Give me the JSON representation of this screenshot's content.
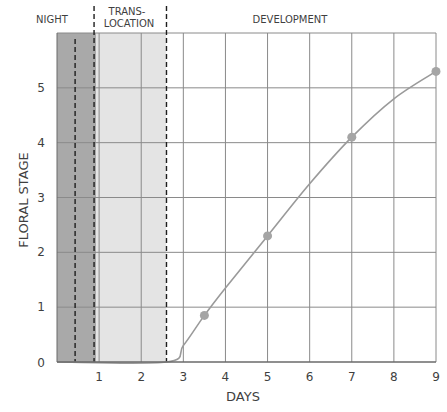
{
  "chart_data": {
    "type": "line",
    "title": "",
    "xlabel": "DAYS",
    "ylabel": "FLORAL STAGE",
    "xlim": [
      0,
      9
    ],
    "ylim": [
      0,
      6
    ],
    "x_ticks": [
      1,
      2,
      3,
      4,
      5,
      6,
      7,
      8,
      9
    ],
    "y_ticks": [
      0,
      1,
      2,
      3,
      4,
      5
    ],
    "grid": true,
    "phases": [
      {
        "label": "NIGHT",
        "start": 0,
        "end": 0.93,
        "shade": "#a9a9a9"
      },
      {
        "label": "TRANS-\nLOCATION",
        "start": 0.93,
        "end": 2.6,
        "shade": "#e4e4e4"
      },
      {
        "label": "DEVELOPMENT",
        "start": 2.6,
        "end": 9,
        "shade": "#ffffff"
      }
    ],
    "dashed_lines_x": [
      0.43,
      0.88,
      2.6
    ],
    "series": [
      {
        "name": "Floral stage",
        "curve_x": [
          0,
          2.6,
          3.0,
          3.5,
          4.0,
          5.0,
          6.0,
          7.0,
          8.0,
          9.0
        ],
        "curve_y": [
          0,
          0,
          0.3,
          0.85,
          1.35,
          2.3,
          3.25,
          4.1,
          4.8,
          5.3
        ],
        "points_x": [
          3.5,
          5,
          7,
          9
        ],
        "points_y": [
          0.85,
          2.3,
          4.1,
          5.3
        ],
        "color": "#9a9a9a"
      }
    ]
  },
  "labels": {
    "night": "NIGHT",
    "trans_1": "TRANS-",
    "trans_2": "LOCATION",
    "development": "DEVELOPMENT",
    "xlabel": "DAYS",
    "ylabel": "FLORAL STAGE",
    "x_ticks": [
      "1",
      "2",
      "3",
      "4",
      "5",
      "6",
      "7",
      "8",
      "9"
    ],
    "y_ticks": [
      "0",
      "1",
      "2",
      "3",
      "4",
      "5"
    ]
  }
}
